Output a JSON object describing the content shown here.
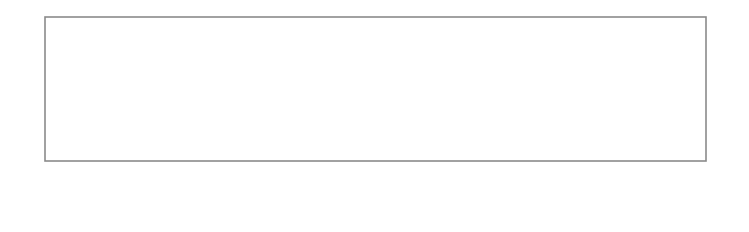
{
  "diagram": {
    "colors": {
      "line": "#8a8a8a",
      "arrow": "#111111",
      "text": "#222222",
      "background": "#ffffff"
    },
    "panel": {
      "left": 45,
      "top": 17,
      "right": 706,
      "bottom": 161
    },
    "fold_lines": [
      {
        "x": 65,
        "type": "dashed"
      },
      {
        "x": 108,
        "type": "solid"
      },
      {
        "x": 163,
        "type": "solid"
      },
      {
        "x": 208,
        "type": "dashed"
      },
      {
        "x": 225,
        "type": "dashed"
      },
      {
        "x": 268,
        "type": "solid"
      },
      {
        "x": 323,
        "type": "solid"
      },
      {
        "x": 366,
        "type": "dashed"
      },
      {
        "x": 384,
        "type": "dashed"
      },
      {
        "x": 427,
        "type": "solid"
      },
      {
        "x": 482,
        "type": "solid"
      },
      {
        "x": 528,
        "type": "dashed"
      },
      {
        "x": 547,
        "type": "dashed"
      },
      {
        "x": 591,
        "type": "solid"
      },
      {
        "x": 643,
        "type": "solid"
      },
      {
        "x": 688,
        "type": "dashed"
      }
    ],
    "pleat_labels": [
      {
        "text": "PLEAT",
        "x": 86
      },
      {
        "text": "PLEAT",
        "x": 186
      },
      {
        "text": "PLEAT",
        "x": 246
      },
      {
        "text": "PLEAT",
        "x": 345
      },
      {
        "text": "PLEAT",
        "x": 405
      },
      {
        "text": "PLEAT",
        "x": 505
      },
      {
        "text": "PLEAT",
        "x": 568
      },
      {
        "text": "PLEAT",
        "x": 666
      }
    ],
    "fold_arrows": [
      {
        "from": 105,
        "to": 68,
        "direction": "left"
      },
      {
        "from": 168,
        "to": 205,
        "direction": "right"
      },
      {
        "from": 265,
        "to": 228,
        "direction": "left"
      },
      {
        "from": 328,
        "to": 363,
        "direction": "right"
      },
      {
        "from": 424,
        "to": 387,
        "direction": "left"
      },
      {
        "from": 487,
        "to": 525,
        "direction": "right"
      },
      {
        "from": 588,
        "to": 550,
        "direction": "left"
      },
      {
        "from": 648,
        "to": 685,
        "direction": "right"
      }
    ],
    "measurements": [
      {
        "label": "2cm/¾in",
        "x": 55
      },
      {
        "label": "9cm/3½in",
        "x": 87
      },
      {
        "label": "12cm/4¾in",
        "x": 136
      },
      {
        "label": "9cm/3½in",
        "x": 186
      },
      {
        "label": "2cm/¾in",
        "x": 216
      },
      {
        "label": "9cm/3½in",
        "x": 246
      },
      {
        "label": "12cm/4¾in",
        "x": 295
      },
      {
        "label": "9cm/3½in",
        "x": 345
      },
      {
        "label": "2cm/¾in",
        "x": 375
      },
      {
        "label": "9cm/3½in",
        "x": 405
      },
      {
        "label": "12cm/4¾in",
        "x": 455
      },
      {
        "label": "9cm/3½in",
        "x": 505
      },
      {
        "label": "2cm/¾in",
        "x": 537
      },
      {
        "label": "9cm/3½in",
        "x": 568
      },
      {
        "label": "12cm/4¾in",
        "x": 617
      },
      {
        "label": "9cm/3½in",
        "x": 666
      },
      {
        "label": "2cm/¾in",
        "x": 697
      }
    ],
    "dimension_spans": [
      {
        "from": 35,
        "to": 45,
        "kind": "outer-left"
      },
      {
        "from": 65,
        "to": 108
      },
      {
        "from": 108,
        "to": 163
      },
      {
        "from": 163,
        "to": 208
      },
      {
        "from": 225,
        "to": 268
      },
      {
        "from": 268,
        "to": 323
      },
      {
        "from": 323,
        "to": 366
      },
      {
        "from": 384,
        "to": 427
      },
      {
        "from": 427,
        "to": 482
      },
      {
        "from": 482,
        "to": 528
      },
      {
        "from": 547,
        "to": 591
      },
      {
        "from": 591,
        "to": 643
      },
      {
        "from": 643,
        "to": 688
      },
      {
        "from": 706,
        "to": 716,
        "kind": "outer-right"
      }
    ]
  }
}
